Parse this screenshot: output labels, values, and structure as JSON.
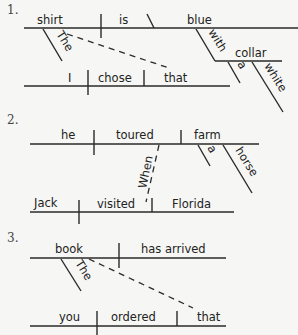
{
  "diagrams": [
    {
      "number": "1.",
      "main_clause": {
        "subject": "shirt",
        "verb": "is",
        "complement": "blue",
        "subject_modifier": "The"
      },
      "prep_phrase": {
        "preposition": "with",
        "object": "collar",
        "modifiers": [
          "a",
          "white"
        ]
      },
      "relative_clause": {
        "subject": "I",
        "verb": "chose",
        "object": "that"
      }
    },
    {
      "number": "2.",
      "subordinate_clause": {
        "subject": "he",
        "verb": "toured",
        "object": "farm",
        "object_modifiers": [
          "a",
          "horse"
        ]
      },
      "connector": "When",
      "main_clause": {
        "subject": "Jack",
        "verb": "visited",
        "object": "Florida"
      }
    },
    {
      "number": "3.",
      "main_clause": {
        "subject": "book",
        "verb": "has arrived",
        "subject_modifier": "The"
      },
      "relative_clause": {
        "subject": "you",
        "verb": "ordered",
        "object": "that"
      }
    }
  ]
}
